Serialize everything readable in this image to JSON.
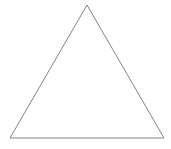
{
  "canvas": {
    "width": 171,
    "height": 149,
    "background_color": "#ffffff"
  },
  "figure": {
    "name": "triangle",
    "shape_type": "triangle",
    "stroke_color": "#848484",
    "stroke_width": 1,
    "fill_color": "none",
    "vertices": [
      {
        "label": "apex",
        "x": 87,
        "y": 5
      },
      {
        "label": "bottom-right",
        "x": 164,
        "y": 138
      },
      {
        "label": "bottom-left",
        "x": 10,
        "y": 138
      }
    ],
    "points_attr": "87,5 164,138 10,138"
  }
}
